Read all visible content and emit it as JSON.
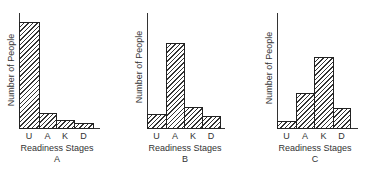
{
  "chart_data": [
    {
      "type": "bar",
      "title": "A",
      "categories": [
        "U",
        "A",
        "K",
        "D"
      ],
      "values": [
        92,
        13,
        7,
        4
      ],
      "xlabel": "Readiness Stages",
      "ylabel": "Number of People",
      "ylim": [
        0,
        100
      ],
      "grid": false,
      "legend": null,
      "style": "hatched"
    },
    {
      "type": "bar",
      "title": "B",
      "categories": [
        "U",
        "A",
        "K",
        "D"
      ],
      "values": [
        12,
        74,
        18,
        10
      ],
      "xlabel": "Readiness Stages",
      "ylabel": "Number of People",
      "ylim": [
        0,
        100
      ],
      "grid": false,
      "legend": null,
      "style": "hatched"
    },
    {
      "type": "bar",
      "title": "C",
      "categories": [
        "U",
        "A",
        "K",
        "D"
      ],
      "values": [
        6,
        30,
        62,
        17
      ],
      "xlabel": "Readiness Stages",
      "ylabel": "Number of People",
      "ylim": [
        0,
        100
      ],
      "grid": false,
      "legend": null,
      "style": "hatched"
    }
  ],
  "layout": {
    "baseline_y": 128,
    "axis_top_y": 13,
    "panels": [
      {
        "axis_x": 19,
        "axis_end_x": 100,
        "bar_edges": [
          19,
          39,
          56,
          74,
          93
        ],
        "ylabel_x": 11,
        "ylabel_y": 70,
        "xlabel_x": 57
      },
      {
        "axis_x": 147,
        "axis_end_x": 225,
        "bar_edges": [
          147,
          166,
          184,
          202,
          220
        ],
        "ylabel_x": 139,
        "ylabel_y": 67,
        "xlabel_x": 185
      },
      {
        "axis_x": 277,
        "axis_end_x": 358,
        "bar_edges": [
          277,
          296,
          314,
          333,
          350
        ],
        "ylabel_x": 269,
        "ylabel_y": 68,
        "xlabel_x": 315
      }
    ]
  }
}
